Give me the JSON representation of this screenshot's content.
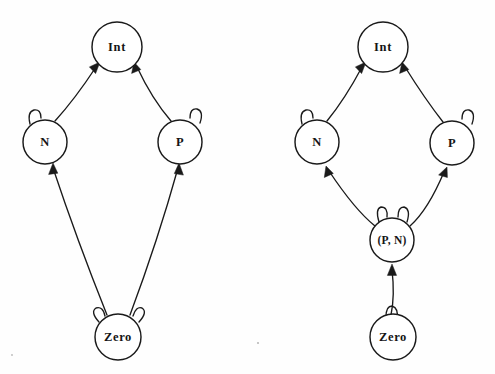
{
  "figure": {
    "kind": "state-transition-diagram-pair",
    "background_color": "#fefefe",
    "stroke_color": "#1a1a1a",
    "fill_color": "#ffffff",
    "width": 495,
    "height": 374
  },
  "diagrams": [
    {
      "id": "left",
      "name": "left-diagram",
      "nodes": [
        {
          "id": "int",
          "label": "Int",
          "cx": 117,
          "cy": 47,
          "r": 25,
          "self_loops": 0
        },
        {
          "id": "n",
          "label": "N",
          "cx": 45,
          "cy": 142,
          "r": 22,
          "self_loops": 1
        },
        {
          "id": "p",
          "label": "P",
          "cx": 180,
          "cy": 142,
          "r": 22,
          "self_loops": 1
        },
        {
          "id": "zero",
          "label": "Zero",
          "cx": 118,
          "cy": 337,
          "r": 23,
          "self_loops": 2
        }
      ],
      "edges": [
        {
          "from": "n",
          "to": "int"
        },
        {
          "from": "p",
          "to": "int"
        },
        {
          "from": "zero",
          "to": "n"
        },
        {
          "from": "zero",
          "to": "p"
        }
      ]
    },
    {
      "id": "right",
      "name": "right-diagram",
      "nodes": [
        {
          "id": "int",
          "label": "Int",
          "cx": 383,
          "cy": 47,
          "r": 25,
          "self_loops": 0
        },
        {
          "id": "n",
          "label": "N",
          "cx": 317,
          "cy": 142,
          "r": 22,
          "self_loops": 1
        },
        {
          "id": "p",
          "label": "P",
          "cx": 452,
          "cy": 143,
          "r": 22,
          "self_loops": 1
        },
        {
          "id": "pn",
          "label": "(P, N)",
          "cx": 392,
          "cy": 240,
          "r": 22,
          "self_loops": 2
        },
        {
          "id": "zero",
          "label": "Zero",
          "cx": 393,
          "cy": 337,
          "r": 23,
          "self_loops": 1
        }
      ],
      "edges": [
        {
          "from": "n",
          "to": "int"
        },
        {
          "from": "p",
          "to": "int"
        },
        {
          "from": "pn",
          "to": "n"
        },
        {
          "from": "pn",
          "to": "p"
        },
        {
          "from": "zero",
          "to": "pn"
        }
      ]
    }
  ],
  "labels": {
    "left": {
      "int": "Int",
      "n": "N",
      "p": "P",
      "zero": "Zero"
    },
    "right": {
      "int": "Int",
      "n": "N",
      "p": "P",
      "pn": "(P, N)",
      "zero": "Zero"
    }
  }
}
